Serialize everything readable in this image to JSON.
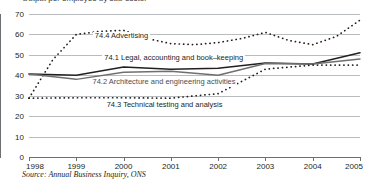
{
  "figure": {
    "title_fragment": "Output per employee by sub-sector",
    "source": "Source: Annual Business Inquiry, ONS"
  },
  "chart_data": {
    "type": "line",
    "title": "Output per employee by sub-sector",
    "xlabel": "",
    "ylabel": "",
    "ylim": [
      0,
      70
    ],
    "yticks": [
      0,
      10,
      20,
      30,
      40,
      50,
      60,
      70
    ],
    "grid": true,
    "legend": "inline-labels",
    "x": [
      1998,
      1999,
      2000,
      2001,
      2002,
      2003,
      2004,
      2005
    ],
    "xticklabels": [
      "1998",
      "1999",
      "2000",
      "2001",
      "2002",
      "2003",
      "2004",
      "2005"
    ],
    "series": [
      {
        "name": "74.4 Advertising",
        "style": "dotted",
        "color": "#231f20",
        "label_x": 1999.35,
        "label_y": 58.5,
        "values": [
          28.8,
          60.0,
          62.0,
          55.5,
          56.0,
          61.0,
          55.0,
          67.0
        ],
        "values_detail": [
          {
            "x": 1998.0,
            "y": 28.8
          },
          {
            "x": 1998.5,
            "y": 47.5
          },
          {
            "x": 1999.0,
            "y": 60.0
          },
          {
            "x": 1999.5,
            "y": 61.5
          },
          {
            "x": 2000.0,
            "y": 62.0
          },
          {
            "x": 2000.5,
            "y": 58.0
          },
          {
            "x": 2001.0,
            "y": 55.5
          },
          {
            "x": 2001.5,
            "y": 55.0
          },
          {
            "x": 2002.0,
            "y": 56.0
          },
          {
            "x": 2002.5,
            "y": 58.0
          },
          {
            "x": 2003.0,
            "y": 61.0
          },
          {
            "x": 2003.5,
            "y": 57.0
          },
          {
            "x": 2004.0,
            "y": 55.0
          },
          {
            "x": 2004.5,
            "y": 59.0
          },
          {
            "x": 2005.0,
            "y": 67.0
          }
        ]
      },
      {
        "name": "74.1 Legal, accounting and book–keeping",
        "style": "solid",
        "color": "#231f20",
        "label_x": 1999.55,
        "label_y": 48.0,
        "values": [
          40.6,
          40.0,
          44.0,
          43.0,
          43.5,
          46.0,
          45.5,
          51.0
        ]
      },
      {
        "name": "74.2 Architecture and engineering activities",
        "style": "solid",
        "color": "#6d7072",
        "label_x": 1999.3,
        "label_y": 36.0,
        "values": [
          40.6,
          38.0,
          41.5,
          42.0,
          40.0,
          45.8,
          45.5,
          48.0
        ]
      },
      {
        "name": "74.3 Technical testing and analysis",
        "style": "dotted",
        "color": "#231f20",
        "label_x": 1999.6,
        "label_y": 25.0,
        "values": [
          28.8,
          29.0,
          29.0,
          28.8,
          31.0,
          43.0,
          45.0,
          45.0
        ],
        "values_detail": [
          {
            "x": 1998.0,
            "y": 28.8
          },
          {
            "x": 1999.0,
            "y": 29.0
          },
          {
            "x": 2000.0,
            "y": 29.0
          },
          {
            "x": 2001.0,
            "y": 28.8
          },
          {
            "x": 2002.0,
            "y": 31.0
          },
          {
            "x": 2002.5,
            "y": 37.0
          },
          {
            "x": 2003.0,
            "y": 43.0
          },
          {
            "x": 2004.0,
            "y": 45.0
          },
          {
            "x": 2005.0,
            "y": 45.0
          }
        ]
      }
    ]
  }
}
